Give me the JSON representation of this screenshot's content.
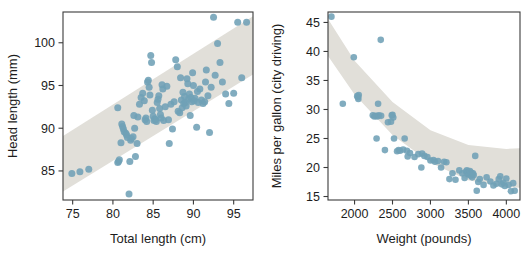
{
  "figure": {
    "panel_count": 2,
    "background": "#ffffff",
    "point_color": "#6fa0b6",
    "band_color": "#e1dfd9",
    "axis_color": "#3b3b3b"
  },
  "chart_data": [
    {
      "type": "scatter",
      "title": "",
      "xlabel": "Total length (cm)",
      "ylabel": "Head length (mm)",
      "xlim": [
        73.8,
        97.4
      ],
      "ylim": [
        81.6,
        103.6
      ],
      "xticks": [
        75,
        80,
        85,
        90,
        95
      ],
      "xticklabels": [
        "75",
        "80",
        "85",
        "90",
        "95"
      ],
      "yticks": [
        85,
        90,
        95,
        100
      ],
      "yticklabels": [
        "85",
        "90",
        "95",
        "100"
      ],
      "grid": false,
      "legend": "none",
      "band": {
        "description": "shaded prediction band, upward-sloping linear",
        "upper": [
          [
            73.8,
            89.1
          ],
          [
            97.4,
            103.1
          ]
        ],
        "lower": [
          [
            73.8,
            82.6
          ],
          [
            97.4,
            96.3
          ]
        ]
      },
      "x": [
        74.9,
        75.9,
        77.0,
        80.6,
        80.6,
        80.7,
        80.8,
        81.0,
        81.1,
        81.2,
        81.3,
        81.4,
        81.6,
        81.7,
        81.8,
        82.0,
        82.1,
        82.2,
        82.3,
        82.5,
        82.6,
        82.7,
        82.8,
        83.0,
        83.1,
        83.3,
        83.5,
        83.7,
        83.9,
        84.0,
        84.1,
        84.2,
        84.3,
        84.4,
        84.5,
        84.6,
        84.7,
        84.8,
        84.9,
        85.0,
        85.1,
        85.2,
        85.3,
        85.4,
        85.5,
        85.6,
        85.7,
        85.8,
        85.9,
        86.0,
        86.1,
        86.2,
        86.3,
        86.5,
        86.7,
        86.9,
        87.0,
        87.2,
        87.4,
        87.6,
        87.8,
        88.0,
        88.1,
        88.3,
        88.4,
        88.5,
        88.6,
        88.7,
        88.8,
        88.9,
        89.0,
        89.1,
        89.2,
        89.3,
        89.4,
        89.5,
        89.6,
        89.7,
        89.8,
        89.9,
        90.0,
        90.1,
        90.2,
        90.4,
        90.5,
        90.6,
        90.8,
        91.0,
        91.2,
        91.4,
        91.5,
        91.6,
        91.8,
        92.0,
        92.2,
        92.5,
        92.7,
        93.0,
        93.3,
        93.6,
        94.0,
        94.4,
        95.0,
        95.5,
        96.0,
        96.6
      ],
      "y": [
        84.7,
        84.9,
        85.2,
        92.4,
        86.0,
        86.1,
        86.3,
        88.3,
        90.5,
        90.2,
        89.9,
        89.6,
        89.4,
        89.2,
        88.9,
        82.3,
        86.1,
        88.6,
        88.8,
        89.0,
        91.5,
        90.0,
        86.7,
        88.2,
        91.3,
        92.8,
        93.6,
        94.1,
        93.2,
        91.0,
        91.2,
        90.8,
        95.4,
        95.6,
        94.8,
        93.9,
        98.5,
        97.7,
        92.1,
        91.4,
        90.9,
        91.1,
        91.0,
        90.8,
        93.0,
        93.4,
        93.8,
        92.3,
        91.6,
        91.2,
        95.1,
        94.6,
        90.9,
        92.5,
        94.9,
        91.0,
        88.2,
        92.8,
        89.9,
        93.1,
        98.0,
        97.2,
        92.0,
        91.8,
        95.9,
        93.3,
        92.4,
        94.2,
        92.9,
        93.7,
        93.0,
        92.6,
        95.8,
        95.2,
        93.4,
        94.0,
        91.5,
        93.6,
        93.1,
        96.5,
        95.0,
        93.2,
        93.5,
        90.1,
        94.3,
        93.0,
        94.6,
        93.3,
        92.9,
        93.1,
        95.4,
        96.8,
        93.8,
        89.5,
        94.8,
        103.0,
        96.2,
        99.9,
        97.7,
        95.4,
        94.0,
        92.9,
        94.1,
        102.4,
        95.9,
        102.4
      ]
    },
    {
      "type": "scatter",
      "title": "",
      "xlabel": "Weight (pounds)",
      "ylabel": "Miles per gallon (city driving)",
      "xlim": [
        1650,
        4180
      ],
      "ylim": [
        14.4,
        46.8
      ],
      "xticks": [
        2000,
        2500,
        3000,
        3500,
        4000
      ],
      "xticklabels": [
        "2000",
        "2500",
        "3000",
        "3500",
        "4000"
      ],
      "yticks": [
        15,
        20,
        25,
        30,
        35,
        40,
        45
      ],
      "yticklabels": [
        "15",
        "20",
        "25",
        "30",
        "35",
        "40",
        "45"
      ],
      "grid": false,
      "legend": "none",
      "band": {
        "description": "shaded prediction band, decreasing curved (quadratic) shape flattening near 23 at right",
        "upper": [
          [
            1650,
            45.6
          ],
          [
            2000,
            38.4
          ],
          [
            2500,
            31.3
          ],
          [
            3000,
            26.4
          ],
          [
            3500,
            23.9
          ],
          [
            4000,
            23.2
          ],
          [
            4180,
            23.3
          ]
        ],
        "lower": [
          [
            1650,
            39.2
          ],
          [
            2000,
            32.6
          ],
          [
            2500,
            25.6
          ],
          [
            3000,
            20.8
          ],
          [
            3500,
            17.8
          ],
          [
            4000,
            16.6
          ],
          [
            4180,
            16.5
          ]
        ]
      },
      "x": [
        1695,
        1845,
        1990,
        2035,
        2045,
        2050,
        2055,
        2240,
        2260,
        2280,
        2290,
        2300,
        2310,
        2320,
        2345,
        2350,
        2400,
        2440,
        2480,
        2490,
        2500,
        2510,
        2520,
        2560,
        2580,
        2600,
        2640,
        2660,
        2690,
        2700,
        2730,
        2790,
        2840,
        2880,
        2890,
        2920,
        2960,
        3000,
        3040,
        3060,
        3100,
        3140,
        3180,
        3210,
        3250,
        3290,
        3330,
        3380,
        3420,
        3450,
        3470,
        3480,
        3490,
        3500,
        3510,
        3520,
        3530,
        3540,
        3550,
        3560,
        3570,
        3590,
        3610,
        3630,
        3650,
        3700,
        3740,
        3790,
        3830,
        3870,
        3900,
        3920,
        3940,
        3960,
        3980,
        4000,
        4030,
        4060,
        4090,
        4110
      ],
      "y": [
        46.0,
        31.0,
        39.0,
        32.3,
        32.1,
        31.8,
        32.5,
        29.0,
        28.8,
        28.9,
        25.0,
        28.8,
        31.0,
        29.0,
        42.0,
        28.9,
        23.0,
        27.8,
        27.9,
        29.0,
        29.1,
        28.6,
        25.0,
        22.8,
        23.0,
        22.9,
        23.1,
        25.0,
        22.9,
        21.9,
        22.5,
        21.8,
        22.3,
        20.0,
        22.4,
        22.0,
        21.8,
        21.2,
        21.3,
        21.0,
        21.1,
        20.0,
        21.0,
        20.9,
        18.0,
        19.0,
        17.9,
        19.5,
        19.0,
        18.2,
        19.3,
        19.5,
        18.9,
        19.2,
        18.8,
        19.4,
        18.6,
        19.1,
        18.3,
        19.0,
        18.7,
        22.0,
        16.0,
        17.5,
        18.0,
        17.0,
        18.3,
        17.6,
        16.9,
        17.2,
        18.0,
        18.5,
        17.1,
        17.4,
        16.8,
        18.1,
        17.0,
        15.9,
        17.3,
        16.0
      ]
    }
  ]
}
